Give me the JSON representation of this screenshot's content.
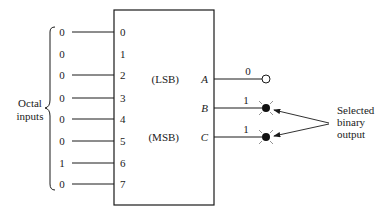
{
  "diagram": {
    "type": "octal-to-binary encoder",
    "inputs_label": [
      "Octal",
      "inputs"
    ],
    "inputs": [
      {
        "pin": "0",
        "value": "0"
      },
      {
        "pin": "1",
        "value": "0"
      },
      {
        "pin": "2",
        "value": "0"
      },
      {
        "pin": "3",
        "value": "0"
      },
      {
        "pin": "4",
        "value": "0"
      },
      {
        "pin": "5",
        "value": "0"
      },
      {
        "pin": "6",
        "value": "1"
      },
      {
        "pin": "7",
        "value": "0"
      }
    ],
    "outputs": [
      {
        "prefix": "(LSB)",
        "name": "A",
        "value": "0",
        "indicator": "off"
      },
      {
        "prefix": "",
        "name": "B",
        "value": "1",
        "indicator": "on"
      },
      {
        "prefix": "(MSB)",
        "name": "C",
        "value": "1",
        "indicator": "on"
      }
    ],
    "output_label": [
      "Selected",
      "binary",
      "output"
    ],
    "colors": {
      "line": "#1a1a1a",
      "input1_wire_start": "#8a3fb0",
      "input1_wire_end": "#7fd07a",
      "box_top_accent": "#b0282c"
    }
  }
}
